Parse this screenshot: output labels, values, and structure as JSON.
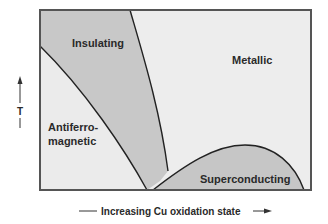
{
  "diagram": {
    "type": "phase-diagram",
    "x_axis": {
      "label": "Increasing Cu oxidation state",
      "direction": "right-arrow"
    },
    "y_axis": {
      "label": "T",
      "direction": "up-arrow"
    },
    "regions": [
      {
        "id": "insulating",
        "label": "Insulating",
        "fill": "#c8c8c8"
      },
      {
        "id": "metallic",
        "label": "Metallic",
        "fill": "#ededed"
      },
      {
        "id": "antiferromagnetic",
        "label_line1": "Antiferro-",
        "label_line2": "magnetic",
        "fill": "#ebebeb"
      },
      {
        "id": "superconducting",
        "label": "Superconducting",
        "fill": "#c6c6c6"
      }
    ],
    "colors": {
      "frame": "#555555",
      "boundary": "#222222",
      "text": "#2a2a2a"
    }
  }
}
